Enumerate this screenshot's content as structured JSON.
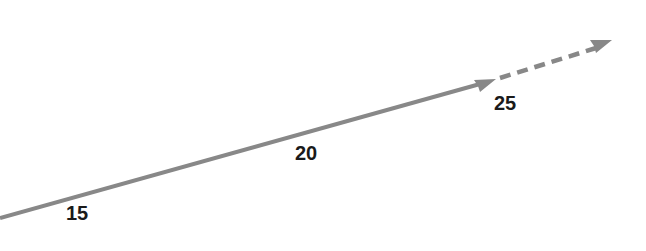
{
  "diagram": {
    "type": "trend-arrow",
    "line_color": "#888888",
    "label_color": "#1a1a1a",
    "solid_segment": {
      "x1": 0,
      "y1": 218,
      "x2": 494,
      "y2": 80
    },
    "dashed_segment": {
      "x1": 500,
      "y1": 78,
      "x2": 608,
      "y2": 44
    },
    "labels": [
      {
        "text": "15",
        "x": 66,
        "y": 202
      },
      {
        "text": "20",
        "x": 295,
        "y": 142
      },
      {
        "text": "25",
        "x": 494,
        "y": 92
      }
    ]
  }
}
